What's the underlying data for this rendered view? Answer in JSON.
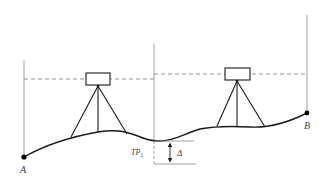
{
  "diagram": {
    "title": "",
    "colors": {
      "ground": "#1a1a1a",
      "rod": "#8a8a8a",
      "sight_line": "#8a8a8a",
      "instrument": "#1a1a1a",
      "point": "#000000",
      "label": "#444444"
    },
    "points": {
      "A": {
        "label": "A"
      },
      "B": {
        "label": "B"
      },
      "TP1": {
        "label": "TP",
        "subscript": "1"
      }
    },
    "annotations": {
      "delta": {
        "label": "Δ"
      }
    },
    "instruments": [
      {
        "name": "level-station-1"
      },
      {
        "name": "level-station-2"
      }
    ]
  }
}
